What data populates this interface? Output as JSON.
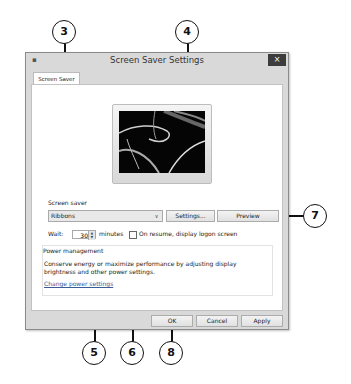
{
  "window": {
    "title": "Screen Saver Settings",
    "close_label": "×",
    "app_icon": "monitor-icon"
  },
  "tabs": [
    {
      "label": "Screen Saver",
      "active": true
    }
  ],
  "screensaver": {
    "section_label": "Screen saver",
    "selected": "Ribbons",
    "dropdown_arrow": "∨",
    "settings_button": "Settings...",
    "preview_button": "Preview"
  },
  "wait": {
    "label": "Wait:",
    "value": "30",
    "unit": "minutes",
    "resume_checkbox_label": "On resume, display logon screen",
    "resume_checked": false
  },
  "power": {
    "group_label": "Power management",
    "description_line1": "Conserve energy or maximize performance by adjusting display",
    "description_line2": "brightness and other power settings.",
    "link": "Change power settings"
  },
  "footer": {
    "ok": "OK",
    "cancel": "Cancel",
    "apply": "Apply"
  },
  "callouts": [
    {
      "number": "3",
      "target": "screen-saver-dropdown"
    },
    {
      "number": "4",
      "target": "settings-button"
    },
    {
      "number": "5",
      "target": "wait-spinner"
    },
    {
      "number": "6",
      "target": "resume-checkbox"
    },
    {
      "number": "7",
      "target": "preview-button"
    },
    {
      "number": "8",
      "target": "ok-button"
    }
  ]
}
